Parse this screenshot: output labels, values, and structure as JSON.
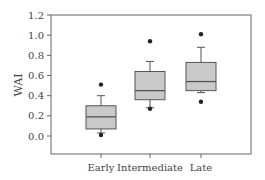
{
  "chart_data": {
    "type": "box",
    "title": "",
    "xlabel": "",
    "ylabel": "WAI",
    "ylim": [
      -0.18,
      1.2
    ],
    "yticks": [
      "0.0",
      "0.2",
      "0.4",
      "0.6",
      "0.8",
      "1.0",
      "1.2"
    ],
    "categories": [
      "Early",
      "Intermediate",
      "Late"
    ],
    "grid": false,
    "legend": null,
    "series": [
      {
        "name": "Early",
        "whisker_low": 0.03,
        "q1": 0.07,
        "median": 0.19,
        "q3": 0.3,
        "whisker_high": 0.4,
        "outliers": [
          0.51,
          0.01
        ]
      },
      {
        "name": "Intermediate",
        "whisker_low": 0.28,
        "q1": 0.36,
        "median": 0.45,
        "q3": 0.64,
        "whisker_high": 0.74,
        "outliers": [
          0.94,
          0.27
        ]
      },
      {
        "name": "Late",
        "whisker_low": 0.43,
        "q1": 0.45,
        "median": 0.54,
        "q3": 0.73,
        "whisker_high": 0.88,
        "outliers": [
          1.01,
          0.34
        ]
      }
    ],
    "colors": {
      "box_fill": "#c9c9c9",
      "stroke": "#555555",
      "outlier": "#222222"
    }
  }
}
